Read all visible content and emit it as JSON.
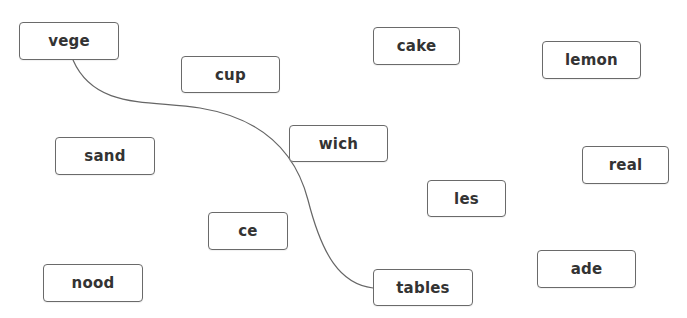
{
  "diagram": {
    "type": "word-matching",
    "colors": {
      "background": "#ffffff",
      "box_border": "#6a6a6a",
      "text": "#333333",
      "connector": "#666666"
    },
    "boxes": [
      {
        "id": "vege",
        "label": "vege",
        "x": 19,
        "y": 22,
        "w": 100,
        "h": 38
      },
      {
        "id": "cup",
        "label": "cup",
        "x": 181,
        "y": 56,
        "w": 99,
        "h": 37
      },
      {
        "id": "cake",
        "label": "cake",
        "x": 373,
        "y": 27,
        "w": 87,
        "h": 38
      },
      {
        "id": "lemon",
        "label": "lemon",
        "x": 542,
        "y": 41,
        "w": 99,
        "h": 38
      },
      {
        "id": "wich",
        "label": "wich",
        "x": 289,
        "y": 125,
        "w": 99,
        "h": 37
      },
      {
        "id": "sand",
        "label": "sand",
        "x": 55,
        "y": 137,
        "w": 100,
        "h": 38
      },
      {
        "id": "real",
        "label": "real",
        "x": 582,
        "y": 146,
        "w": 87,
        "h": 38
      },
      {
        "id": "les",
        "label": "les",
        "x": 427,
        "y": 180,
        "w": 79,
        "h": 37
      },
      {
        "id": "ce",
        "label": "ce",
        "x": 208,
        "y": 212,
        "w": 80,
        "h": 38
      },
      {
        "id": "nood",
        "label": "nood",
        "x": 43,
        "y": 264,
        "w": 100,
        "h": 38
      },
      {
        "id": "tables",
        "label": "tables",
        "x": 373,
        "y": 269,
        "w": 100,
        "h": 37
      },
      {
        "id": "ade",
        "label": "ade",
        "x": 537,
        "y": 250,
        "w": 99,
        "h": 38
      }
    ],
    "connections": [
      {
        "from": "vege",
        "to": "tables",
        "path": "M 73 60 C 95 110, 150 100, 200 108 C 260 118, 295 150, 308 200 C 322 255, 340 284, 373 288"
      }
    ]
  }
}
